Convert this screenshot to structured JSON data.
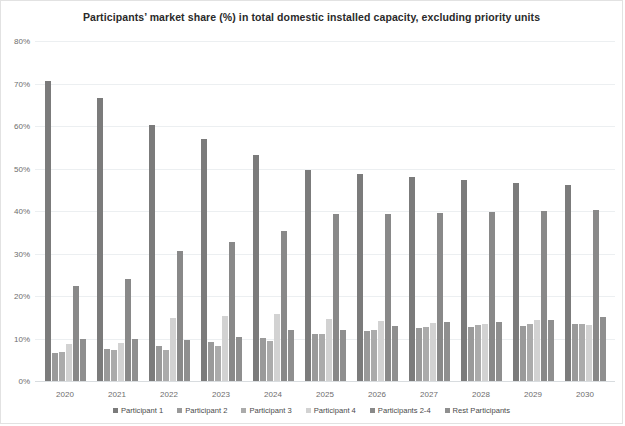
{
  "chart_data": {
    "type": "bar",
    "title": "Participants’ market share (%) in total domestic installed capacity, excluding priority units",
    "xlabel": "",
    "ylabel": "",
    "ylim": [
      0,
      80
    ],
    "ytick_labels": [
      "0%",
      "10%",
      "20%",
      "30%",
      "40%",
      "50%",
      "60%",
      "70%",
      "80%"
    ],
    "ytick_values": [
      0,
      10,
      20,
      30,
      40,
      50,
      60,
      70,
      80
    ],
    "grid": true,
    "legend_position": "bottom",
    "categories": [
      "2020",
      "2021",
      "2022",
      "2023",
      "2024",
      "2025",
      "2026",
      "2027",
      "2028",
      "2029",
      "2030"
    ],
    "series": [
      {
        "name": "Participant 1",
        "color": "#7b7b7b",
        "values": [
          70.6,
          66.5,
          60.2,
          57.0,
          53.2,
          49.6,
          48.6,
          48.0,
          47.3,
          46.7,
          46.2
        ]
      },
      {
        "name": "Participant 2",
        "color": "#9a9a9a",
        "values": [
          6.6,
          7.6,
          8.3,
          9.1,
          10.2,
          11.1,
          11.7,
          12.5,
          12.7,
          13.0,
          13.5
        ]
      },
      {
        "name": "Participant 3",
        "color": "#ababab",
        "values": [
          6.9,
          7.4,
          7.4,
          8.3,
          9.4,
          11.0,
          12.0,
          12.8,
          13.2,
          13.3,
          13.4
        ]
      },
      {
        "name": "Participant 4",
        "color": "#d2d2d2",
        "values": [
          8.8,
          9.0,
          14.8,
          15.3,
          15.8,
          14.7,
          14.1,
          13.6,
          13.5,
          14.3,
          13.2
        ]
      },
      {
        "name": "Participants 2-4",
        "color": "#898989",
        "values": [
          22.3,
          24.0,
          30.5,
          32.7,
          35.4,
          39.3,
          39.4,
          39.5,
          39.7,
          40.0,
          40.3
        ]
      },
      {
        "name": "Rest Participants",
        "color": "#8f8f8f",
        "values": [
          9.8,
          9.8,
          9.6,
          10.4,
          11.9,
          12.1,
          12.9,
          13.8,
          14.0,
          14.4,
          15.0
        ]
      }
    ]
  },
  "colors": {
    "background": "#ffffff",
    "grid": "#eceff1",
    "axis_text": "#6d6d6d",
    "title_text": "#2a2a2a",
    "frame": "#e2e2e2"
  }
}
